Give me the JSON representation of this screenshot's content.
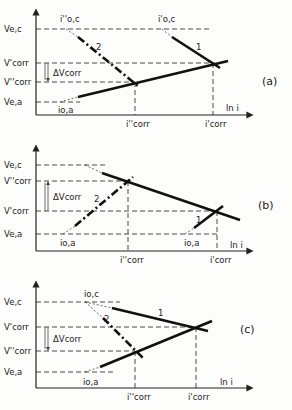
{
  "panels": [
    {
      "id": "a",
      "label": "(a)",
      "x_axis_label": "ln i",
      "y_labels": {
        "ve_c": "Ve,c",
        "vcorr_prime": "V'corr",
        "delta_v": "ΔVcorr",
        "vcorr_dprime": "V''corr",
        "ve_a": "Ve,a"
      },
      "point_labels": {
        "io_c_dprime": "i''o,c",
        "io_c_prime": "i'o,c",
        "io_a": "io,a",
        "curve1": "1",
        "curve2": "2"
      },
      "x_labels": {
        "icorr_dprime": "i''corr",
        "icorr_prime": "i'corr"
      }
    },
    {
      "id": "b",
      "label": "(b)",
      "x_axis_label": "ln i",
      "y_labels": {
        "ve_c": "Ve,c",
        "vcorr_dprime": "V''corr",
        "delta_v": "ΔVcorr",
        "vcorr_prime": "V'corr",
        "ve_a": "Ve,a"
      },
      "point_labels": {
        "io_a_left": "io,a",
        "io_a_right": "io,a",
        "curve1": "1",
        "curve2": "2"
      },
      "x_labels": {
        "icorr_dprime": "i''corr",
        "icorr_prime": "i'corr"
      }
    },
    {
      "id": "c",
      "label": "(c)",
      "x_axis_label": "ln i",
      "y_labels": {
        "ve_c": "Ve,c",
        "vcorr_prime": "V'corr",
        "delta_v": "ΔVcorr",
        "vcorr_dprime": "V''corr",
        "ve_a": "Ve,a"
      },
      "point_labels": {
        "io_c": "io,c",
        "io_a": "io,a",
        "curve1": "1",
        "curve2": "2"
      },
      "x_labels": {
        "icorr_dprime": "i''corr",
        "icorr_prime": "i'corr"
      }
    }
  ]
}
